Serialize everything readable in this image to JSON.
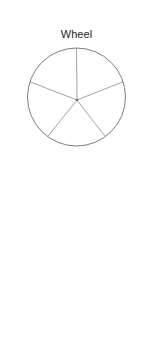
{
  "page": {
    "background_color": "#ffffff",
    "width": 153,
    "height": 354
  },
  "figures": [
    {
      "id": "wheel",
      "caption": "Wheel",
      "type": "wheel-network-diagram",
      "description": "Circle with five spokes radiating from a central hub",
      "style": {
        "edge_color": "#8a8a8a",
        "outline_color": "#6f6f6f",
        "node_color": "#3a3a3a",
        "stroke_width": 0.8
      },
      "geometry": {
        "shape": "circle",
        "center": [
          76.5,
          53
        ],
        "radius": 49,
        "hub": [
          77,
          56
        ],
        "spoke_count": 5,
        "spoke_angles_deg": [
          90,
          162,
          234,
          306,
          18
        ],
        "rim_points": [
          [
            76.5,
            4
          ],
          [
            29.9,
            37.8
          ],
          [
            47.7,
            92.6
          ],
          [
            105.3,
            92.6
          ],
          [
            123.1,
            37.8
          ]
        ]
      }
    },
    {
      "id": "all-channel",
      "caption": "All channel",
      "type": "complete-graph-diagram",
      "description": "Hexagon with every vertex connected to every other vertex (K6)",
      "style": {
        "edge_color": "#8a8a8a",
        "outline_color": "#6f6f6f",
        "node_color": "#3a3a3a",
        "stroke_width": 0.8
      },
      "geometry": {
        "shape": "hexagon",
        "vertex_count": 6,
        "edge_count": 15,
        "vertices": [
          {
            "name": "top",
            "x": 77,
            "y": 8
          },
          {
            "name": "upper-right",
            "x": 122,
            "y": 28
          },
          {
            "name": "lower-right",
            "x": 122,
            "y": 112
          },
          {
            "name": "bottom",
            "x": 77,
            "y": 132
          },
          {
            "name": "lower-left",
            "x": 32,
            "y": 112
          },
          {
            "name": "upper-left",
            "x": 32,
            "y": 28
          }
        ],
        "edges": [
          [
            0,
            1
          ],
          [
            0,
            2
          ],
          [
            0,
            3
          ],
          [
            0,
            4
          ],
          [
            0,
            5
          ],
          [
            1,
            2
          ],
          [
            1,
            3
          ],
          [
            1,
            4
          ],
          [
            1,
            5
          ],
          [
            2,
            3
          ],
          [
            2,
            4
          ],
          [
            2,
            5
          ],
          [
            3,
            4
          ],
          [
            3,
            5
          ],
          [
            4,
            5
          ]
        ]
      }
    }
  ]
}
